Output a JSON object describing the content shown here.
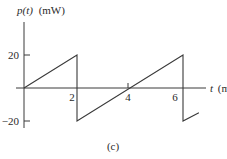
{
  "chart_data": {
    "type": "line",
    "title": "",
    "ylabel": "p(t) (mW)",
    "ylabel_var": "p(t)",
    "ylabel_unit": "(mW)",
    "xlabel": "t (ms)",
    "xlabel_var": "t",
    "xlabel_unit": "(ms)",
    "caption": "(c)",
    "yticks": [
      20,
      -20
    ],
    "ytick_labels": [
      "20",
      "−20"
    ],
    "xticks": [
      2,
      4,
      6
    ],
    "xtick_labels": [
      "2",
      "4",
      "6"
    ],
    "xlim": [
      0,
      7
    ],
    "ylim": [
      -25,
      35
    ],
    "grid": false,
    "legend": null,
    "series": [
      {
        "name": "p(t)",
        "x": [
          0,
          2,
          2,
          6,
          6,
          6.6
        ],
        "y": [
          0,
          20,
          -20,
          20,
          -20,
          -15
        ]
      }
    ]
  }
}
